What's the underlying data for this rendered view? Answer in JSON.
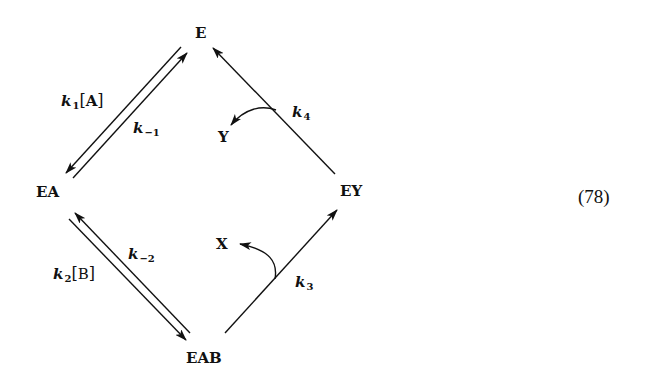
{
  "diagram": {
    "type": "enzyme kinetic mechanism (ping-pong)",
    "nodes": {
      "E": "E",
      "EA": "EA",
      "EAB": "EAB",
      "EY": "EY",
      "X": "X",
      "Y": "Y"
    },
    "rates": {
      "k1": {
        "k": "k",
        "sub": "1",
        "species": "A"
      },
      "k_minus1": {
        "k": "k",
        "sub": "−1"
      },
      "k2": {
        "k": "k",
        "sub": "2",
        "species": "B"
      },
      "k_minus2": {
        "k": "k",
        "sub": "−2"
      },
      "k3": {
        "k": "k",
        "sub": "3"
      },
      "k4": {
        "k": "k",
        "sub": "4"
      }
    },
    "edges": [
      {
        "from": "E",
        "to": "EA",
        "label": "k1[A]",
        "reversible": true
      },
      {
        "from": "EA",
        "to": "E",
        "label": "k-1"
      },
      {
        "from": "EA",
        "to": "EAB",
        "label": "k2[B]",
        "reversible": true
      },
      {
        "from": "EAB",
        "to": "EA",
        "label": "k-2"
      },
      {
        "from": "EAB",
        "to": "EY",
        "label": "k3",
        "releases": "X"
      },
      {
        "from": "EY",
        "to": "E",
        "label": "k4",
        "releases": "Y"
      }
    ],
    "equation_number": "(78)",
    "colors": {
      "ink": "#111111",
      "background": "#ffffff"
    }
  }
}
